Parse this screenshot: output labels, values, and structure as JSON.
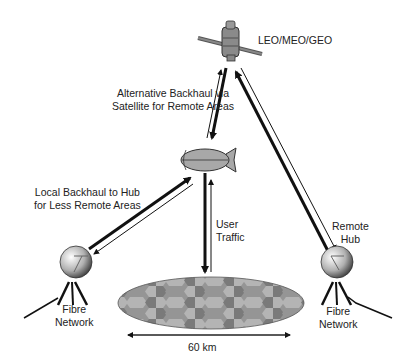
{
  "diagram": {
    "satellite_label": "LEO/MEO/GEO",
    "alt_backhaul": {
      "line1": "Alternative Backhaul via",
      "line2": "Satellite for Remote Areas"
    },
    "local_backhaul": {
      "line1": "Local Backhaul to Hub",
      "line2": "for Less Remote Areas"
    },
    "user_traffic": {
      "line1": "User",
      "line2": "Traffic"
    },
    "remote_hub": {
      "line1": "Remote",
      "line2": "Hub"
    },
    "fibre_left": {
      "line1": "Fibre",
      "line2": "Network"
    },
    "fibre_right": {
      "line1": "Fibre",
      "line2": "Network"
    },
    "coverage_width": "60 km",
    "colors": {
      "line": "#111111",
      "airship": "#a8a8a8",
      "hex_dark": "#7a7a7a",
      "hex_mid": "#959595",
      "hex_light": "#b4b4b4"
    }
  }
}
